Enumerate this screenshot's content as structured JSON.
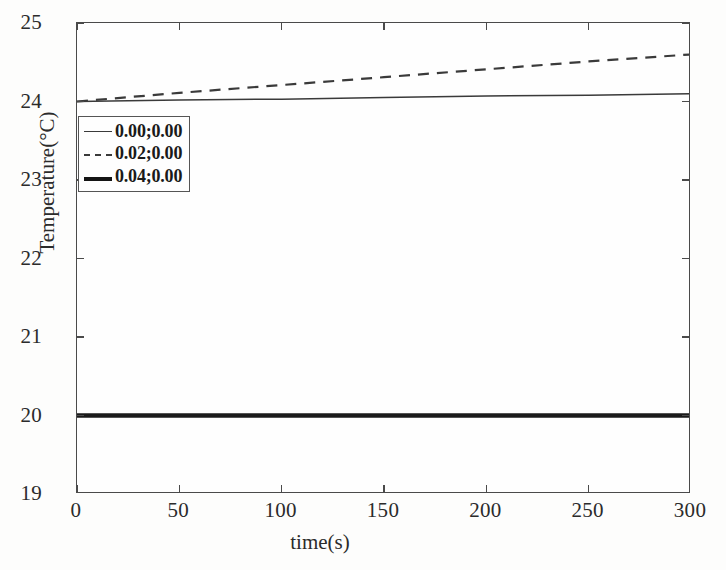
{
  "chart_data": {
    "type": "line",
    "title": "",
    "xlabel": "time(s)",
    "ylabel": "Temperature(°C)",
    "xlim": [
      0,
      300
    ],
    "ylim": [
      19,
      25
    ],
    "xticks": [
      "0",
      "50",
      "100",
      "150",
      "200",
      "250",
      "300"
    ],
    "yticks": [
      "19",
      "20",
      "21",
      "22",
      "23",
      "24",
      "25"
    ],
    "xtick_values": [
      0,
      50,
      100,
      150,
      200,
      250,
      300
    ],
    "ytick_values": [
      19,
      20,
      21,
      22,
      23,
      24,
      25
    ],
    "grid": false,
    "legend_position": "upper left",
    "x": [
      0,
      50,
      100,
      150,
      200,
      250,
      300
    ],
    "series": [
      {
        "name": "0.00;0.00",
        "style": "solid-thin",
        "color": "#3a3a3a",
        "values": [
          24.0,
          24.02,
          24.03,
          24.05,
          24.07,
          24.08,
          24.1
        ]
      },
      {
        "name": "0.02;0.00",
        "style": "dashed",
        "color": "#3a3a3a",
        "values": [
          24.0,
          24.11,
          24.21,
          24.31,
          24.41,
          24.51,
          24.6
        ]
      },
      {
        "name": "0.04;0.00",
        "style": "solid-thick",
        "color": "#1a1a1a",
        "values": [
          20.0,
          20.0,
          20.0,
          20.0,
          20.0,
          20.0,
          20.0
        ]
      }
    ]
  },
  "legend": {
    "entries": [
      {
        "label": "0.00;0.00"
      },
      {
        "label": "0.02;0.00"
      },
      {
        "label": "0.04;0.00"
      }
    ]
  },
  "colors": {
    "axis": "#4a4a4a",
    "text": "#2b2b2b",
    "background": "#fdfdfc",
    "series_thin": "#3a3a3a",
    "series_dashed": "#3a3a3a",
    "series_thick": "#1a1a1a"
  }
}
